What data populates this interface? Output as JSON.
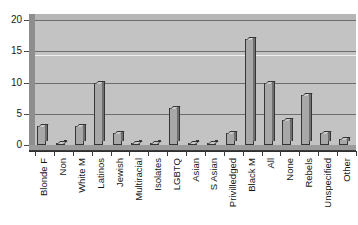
{
  "chart_data": {
    "type": "bar",
    "title": "",
    "subtitle": "",
    "xlabel": "",
    "ylabel": "",
    "ylim": [
      0,
      20
    ],
    "y_ticks": [
      0,
      5,
      10,
      15,
      20
    ],
    "grid": true,
    "legend": "none",
    "style": "grayscale-3d-bar",
    "categories": [
      "Blonde F",
      "Non",
      "White M",
      "Latinos",
      "Jewish",
      "Multiracial",
      "Isolates",
      "LGBTQ",
      "Asian",
      "S Asian",
      "Privilledged",
      "Black M",
      "All",
      "None",
      "Rebels",
      "Unspecified",
      "Other"
    ],
    "values": [
      3,
      0,
      3,
      10,
      2,
      0,
      0,
      6,
      0,
      0,
      2,
      17,
      10,
      4,
      8,
      2,
      1
    ],
    "colors": {
      "bar_face": "#a8a8a8",
      "bar_top": "#c9c9c9",
      "bar_side": "#6f6f6f",
      "bar_outline": "#353535",
      "plot_background": "#c3c3c3",
      "wall_left": "#8e8e8e",
      "wall_top": "#b6b6b6",
      "floor": "#9b9b9b",
      "gridline": "#6d6d6d",
      "gridline_highlight": "#efefef",
      "axis": "#2f2f2f",
      "text": "#151515",
      "page_background": "#ffffff"
    }
  }
}
